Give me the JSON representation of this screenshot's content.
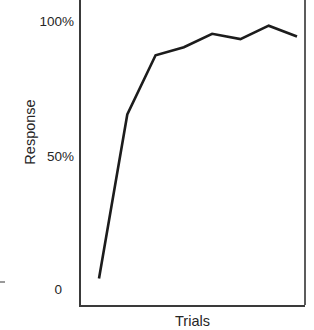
{
  "chart_data": {
    "type": "line",
    "title": "",
    "xlabel": "Trials",
    "ylabel": "Response",
    "ylim": [
      0,
      100
    ],
    "ytick_labels": [
      "100%",
      "50%",
      "0"
    ],
    "ytick_values": [
      100,
      50,
      0
    ],
    "xtick_labels": [],
    "grid": false,
    "legend": null,
    "series": [
      {
        "name": "Response",
        "x": [
          1,
          2,
          3,
          4,
          5,
          6,
          7,
          8
        ],
        "values": [
          5,
          66,
          88,
          91,
          96,
          94,
          99,
          95
        ]
      }
    ],
    "annotations": []
  },
  "axes": {
    "y_title": "Response",
    "x_title": "Trials",
    "ticks": {
      "top": "100%",
      "middle": "50%",
      "bottom": "0"
    }
  },
  "style": {
    "line_color": "#1c1c1c",
    "axis_color": "#3a3a3a",
    "frame_color": "#5c5c5c",
    "text_color": "#262626",
    "background": "#ffffff"
  }
}
